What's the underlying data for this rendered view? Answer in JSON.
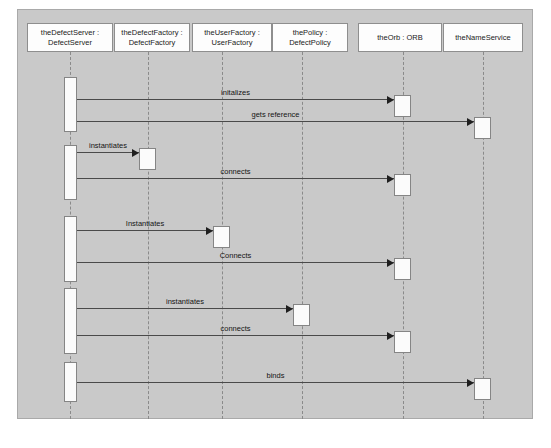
{
  "diagram": {
    "type": "uml-sequence-diagram",
    "canvas": {
      "background_color": "#c9c9c9",
      "border_color": "#a9a9a9",
      "page_background": "#ffffff"
    },
    "style": {
      "box_fill": "#fdfdfd",
      "box_border": "#8e8e8e",
      "lifeline_color": "#8a8a8a",
      "arrow_color": "#4a4a4a",
      "arrow_head_color": "#1f1f1f",
      "text_color": "#141414"
    },
    "lifelines": [
      {
        "id": "defectserver",
        "line1": "theDefectServer :",
        "line2": "DefectServer",
        "x": 70,
        "box_left": 27,
        "box_top": 23,
        "box_width": 86,
        "box_height": 29
      },
      {
        "id": "defectfactory",
        "line1": "theDefectFactory :",
        "line2": "DefectFactory",
        "x": 148,
        "box_left": 114,
        "box_top": 23,
        "box_width": 76,
        "box_height": 29
      },
      {
        "id": "userfactory",
        "line1": "theUserFactory :",
        "line2": "UserFactory",
        "x": 222,
        "box_left": 192,
        "box_top": 23,
        "box_width": 80,
        "box_height": 29
      },
      {
        "id": "policy",
        "line1": "thePolicy :",
        "line2": "DefectPolicy",
        "x": 302,
        "box_left": 272,
        "box_top": 23,
        "box_width": 76,
        "box_height": 29
      },
      {
        "id": "orb",
        "line1": "theOrb : ORB",
        "line2": "",
        "x": 403,
        "box_left": 358,
        "box_top": 23,
        "box_width": 84,
        "box_height": 29
      },
      {
        "id": "nameservice",
        "line1": "theNameService",
        "line2": "",
        "x": 483,
        "box_left": 443,
        "box_top": 23,
        "box_width": 80,
        "box_height": 29
      }
    ],
    "source_activations": [
      {
        "lifeline": "defectserver",
        "top": 77,
        "height": 55
      },
      {
        "lifeline": "defectserver",
        "top": 145,
        "height": 55
      },
      {
        "lifeline": "defectserver",
        "top": 216,
        "height": 66
      },
      {
        "lifeline": "defectserver",
        "top": 288,
        "height": 66
      },
      {
        "lifeline": "defectserver",
        "top": 362,
        "height": 40
      }
    ],
    "messages": [
      {
        "label": "initalizes",
        "from": "defectserver",
        "to": "orb",
        "y": 99,
        "target_box_top": 95,
        "target_box_width": 17,
        "target_box_height": 22
      },
      {
        "label": "gets reference",
        "from": "defectserver",
        "to": "nameservice",
        "y": 121,
        "target_box_top": 117,
        "target_box_width": 17,
        "target_box_height": 22
      },
      {
        "label": "instantiates",
        "from": "defectserver",
        "to": "defectfactory",
        "y": 152,
        "target_box_top": 148,
        "target_box_width": 17,
        "target_box_height": 22
      },
      {
        "label": "connects",
        "from": "defectserver",
        "to": "orb",
        "y": 178,
        "target_box_top": 174,
        "target_box_width": 17,
        "target_box_height": 22
      },
      {
        "label": "Instantiates",
        "from": "defectserver",
        "to": "userfactory",
        "y": 230,
        "target_box_top": 226,
        "target_box_width": 17,
        "target_box_height": 22
      },
      {
        "label": "Connects",
        "from": "defectserver",
        "to": "orb",
        "y": 262,
        "target_box_top": 258,
        "target_box_width": 17,
        "target_box_height": 22
      },
      {
        "label": "instantiates",
        "from": "defectserver",
        "to": "policy",
        "y": 308,
        "target_box_top": 304,
        "target_box_width": 17,
        "target_box_height": 22
      },
      {
        "label": "connects",
        "from": "defectserver",
        "to": "orb",
        "y": 335,
        "target_box_top": 331,
        "target_box_width": 17,
        "target_box_height": 22
      },
      {
        "label": "binds",
        "from": "defectserver",
        "to": "nameservice",
        "y": 382,
        "target_box_top": 378,
        "target_box_width": 17,
        "target_box_height": 22
      }
    ]
  }
}
